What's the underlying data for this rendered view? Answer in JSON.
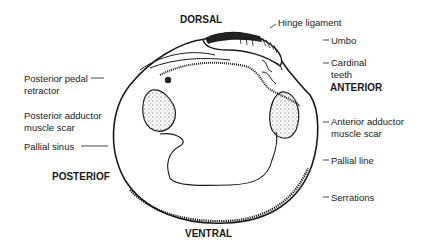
{
  "diagram": {
    "type": "anatomical-diagram",
    "orientation": {
      "top": "DORSAL",
      "bottom": "VENTRAL",
      "left": "POSTERIOF",
      "right": "ANTERIOR"
    },
    "labels": {
      "hinge_ligament": "Hinge ligament",
      "umbo": "Umbo",
      "cardinal_teeth_1": "Cardinal",
      "cardinal_teeth_2": "teeth",
      "posterior_pedal_retractor_1": "Posterior pedal",
      "posterior_pedal_retractor_2": "retractor",
      "posterior_adductor_1": "Posterior adductor",
      "posterior_adductor_2": "muscle scar",
      "pallial_sinus": "Pallial sinus",
      "anterior_adductor_1": "Anterior adductor",
      "anterior_adductor_2": "muscle scar",
      "pallial_line": "Pallial line",
      "serrations": "Serrations"
    },
    "colors": {
      "ink": "#1a1a1a",
      "background": "#ffffff"
    }
  }
}
